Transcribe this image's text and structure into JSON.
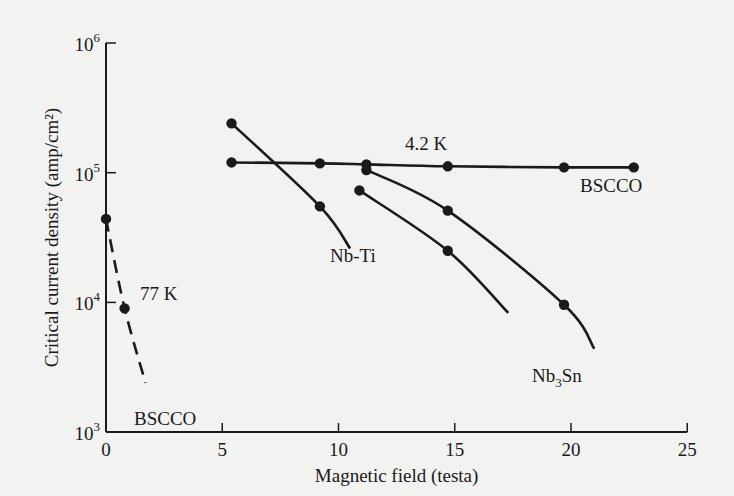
{
  "chart_data": {
    "type": "line",
    "title": "",
    "xlabel": "Magnetic field (testa)",
    "ylabel": "Critical current density (amp/cm²)",
    "xlim": [
      0,
      25
    ],
    "ylim": [
      1000,
      1000000
    ],
    "yscale": "log",
    "x_ticks": [
      "0",
      "5",
      "10",
      "15",
      "20",
      "25"
    ],
    "y_ticks": [
      {
        "base": "10",
        "exp": "3"
      },
      {
        "base": "10",
        "exp": "4"
      },
      {
        "base": "10",
        "exp": "5"
      },
      {
        "base": "10",
        "exp": "6"
      }
    ],
    "grid": false,
    "annotations": [
      "4.2 K",
      "77 K",
      "BSCCO",
      "BSCCO",
      "Nb-Ti",
      "Nb3Sn"
    ],
    "series": [
      {
        "name": "BSCCO (4.2 K)",
        "style": "solid",
        "points": [
          [
            5.4,
            120000
          ],
          [
            9.2,
            118000
          ],
          [
            11.2,
            116000
          ],
          [
            14.7,
            112000
          ],
          [
            19.7,
            110000
          ],
          [
            22.7,
            110000
          ]
        ]
      },
      {
        "name": "Nb-Ti",
        "style": "solid",
        "points": [
          [
            5.4,
            240000
          ],
          [
            9.2,
            55000
          ]
        ],
        "curve_end": [
          10.5,
          26000
        ]
      },
      {
        "name": "Nb3Sn (upper)",
        "style": "solid",
        "points": [
          [
            11.2,
            105000
          ],
          [
            14.7,
            51000
          ],
          [
            19.7,
            9600
          ]
        ],
        "curve_end": [
          21.0,
          4400
        ]
      },
      {
        "name": "Nb3Sn (lower)",
        "style": "solid",
        "points": [
          [
            10.9,
            73000
          ],
          [
            14.7,
            25000
          ]
        ],
        "curve_end": [
          17.3,
          8300
        ]
      },
      {
        "name": "BSCCO (77 K)",
        "style": "dashed",
        "points": [
          [
            0,
            44000
          ],
          [
            0.8,
            9000
          ]
        ],
        "curve_end": [
          1.7,
          2400
        ]
      }
    ]
  }
}
